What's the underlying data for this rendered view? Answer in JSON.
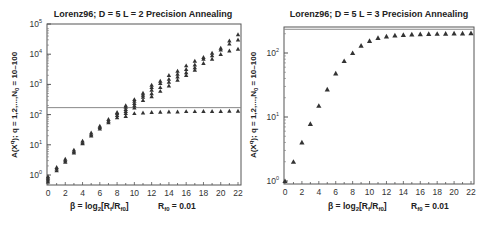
{
  "chart_data": [
    {
      "type": "scatter",
      "title": "Lorenz96; D = 5   L = 2   Precision Annealing",
      "xlabel": "β = log2[Rf/Rf0]",
      "xlabel_note": "Rf0 = 0.01",
      "ylabel": "A(X^q); q = 1,2,...,N0 = 10–100",
      "yscale": "log",
      "ylim": [
        0.5,
        100000
      ],
      "xlim": [
        0,
        22.3
      ],
      "xticks": [
        0,
        2,
        4,
        6,
        8,
        10,
        12,
        14,
        16,
        18,
        20,
        22
      ],
      "yticks": [
        "10^0",
        "10^1",
        "10^2",
        "10^3",
        "10^4",
        "10^5"
      ],
      "reference_line_y": 170,
      "marker": "triangle",
      "series": [
        {
          "name": "upper branch (multiple minima)",
          "x": [
            0,
            1,
            2,
            3,
            4,
            5,
            6,
            7,
            8,
            9,
            10,
            11,
            12,
            13,
            14,
            15,
            16,
            17,
            18,
            19,
            20,
            21,
            22
          ],
          "values": [
            [
              0.6,
              0.7,
              0.8,
              0.9
            ],
            [
              1.4,
              1.6,
              1.8
            ],
            [
              2.7,
              3.0,
              3.4
            ],
            [
              5.5,
              6.0,
              6.8
            ],
            [
              11,
              12,
              13.5
            ],
            [
              20,
              22,
              25
            ],
            [
              34,
              38,
              42
            ],
            [
              55,
              62,
              70
            ],
            [
              80,
              95,
              110,
              120
            ],
            [
              110,
              130,
              150,
              180,
              200
            ],
            [
              170,
              200,
              240,
              280,
              320
            ],
            [
              300,
              380,
              450,
              520
            ],
            [
              400,
              500,
              650,
              800,
              950
            ],
            [
              600,
              800,
              1100,
              1300
            ],
            [
              900,
              1200,
              1500,
              2000
            ],
            [
              1400,
              1800,
              2200,
              2800
            ],
            [
              2000,
              2500,
              3200,
              4200
            ],
            [
              3000,
              3600,
              4500,
              6000
            ],
            [
              5000,
              7000,
              8000
            ],
            [
              7000,
              9000,
              11000
            ],
            [
              10000,
              14000,
              16000
            ],
            [
              13000,
              22000,
              28000
            ],
            [
              15000,
              30000,
              45000
            ]
          ]
        },
        {
          "name": "lower branch (plateau)",
          "x": [
            9,
            10,
            11,
            12,
            13,
            14,
            15,
            16,
            17,
            18,
            19,
            20,
            21,
            22
          ],
          "values": [
            88,
            110,
            115,
            120,
            122,
            125,
            125,
            128,
            128,
            130,
            130,
            130,
            132,
            132
          ]
        }
      ],
      "grid": false,
      "legend": "none"
    },
    {
      "type": "scatter",
      "title": "Lorenz96; D = 5   L = 3   Precision Annealing",
      "xlabel": "β = log2[Rf/Rf0]",
      "xlabel_note": "Rf0 = 0.01",
      "ylabel": "A(X^q); q = 1,2,...,N0 = 10–100",
      "yscale": "log",
      "ylim": [
        0.95,
        250
      ],
      "xlim": [
        0,
        22.3
      ],
      "xticks": [
        0,
        2,
        4,
        6,
        8,
        10,
        12,
        14,
        16,
        18,
        20,
        22
      ],
      "yticks": [
        "10^0",
        "10^1",
        "10^2"
      ],
      "reference_line_y": 235,
      "marker": "triangle",
      "series": [
        {
          "name": "action levels",
          "x": [
            0,
            1,
            2,
            3,
            4,
            5,
            6,
            7,
            8,
            9,
            10,
            11,
            12,
            13,
            14,
            15,
            16,
            17,
            18,
            19,
            20,
            21,
            22
          ],
          "values": [
            1.0,
            2.0,
            4.0,
            7.8,
            15,
            27,
            48,
            75,
            100,
            130,
            155,
            172,
            182,
            188,
            192,
            195,
            197,
            199,
            200,
            201,
            202,
            203,
            205
          ]
        }
      ],
      "grid": false,
      "legend": "none"
    }
  ],
  "panels": [
    {
      "title": "Lorenz96; D = 5   L = 2   Precision Annealing",
      "ylabel_main": "A(X",
      "ylabel_sup": "q",
      "ylabel_rest": "); q = 1,2,...,N",
      "ylabel_sub": "0",
      "ylabel_end": " = 10–100",
      "xlabel_main": "β = log",
      "xlabel_sub1": "2",
      "xlabel_mid": "[R",
      "xlabel_sub2": "f",
      "xlabel_mid2": "/R",
      "xlabel_sub3": "f0",
      "xlabel_end": "]",
      "r_label": "R",
      "r_sub": "f0",
      "r_value": " = 0.01"
    },
    {
      "title": "Lorenz96; D = 5   L = 3   Precision Annealing",
      "ylabel_main": "A(X",
      "ylabel_sup": "q",
      "ylabel_rest": "); q = 1,2,...,N",
      "ylabel_sub": "0",
      "ylabel_end": " = 10–100",
      "xlabel_main": "β = log",
      "xlabel_sub1": "2",
      "xlabel_mid": "[R",
      "xlabel_sub2": "f",
      "xlabel_mid2": "/R",
      "xlabel_sub3": "f0",
      "xlabel_end": "]",
      "r_label": "R",
      "r_sub": "f0",
      "r_value": " = 0.01"
    }
  ],
  "colors": {
    "marker": "#333333",
    "axis": "#555555",
    "reference_line": "#888888"
  }
}
